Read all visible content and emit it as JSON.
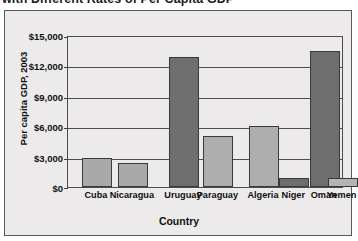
{
  "title": {
    "text": "with Different Rates of Per Capita GDP"
  },
  "chart_data": {
    "type": "bar",
    "title": "with Different Rates of Per Capita GDP",
    "xlabel": "Country",
    "ylabel": "Per capita GDP, 2003",
    "categories": [
      "Cuba",
      "Nicaragua",
      "Uruguay",
      "Paraguay",
      "Algeria",
      "Niger",
      "Oman",
      "Yemen"
    ],
    "values": [
      2900,
      2400,
      12800,
      5000,
      6050,
      900,
      13400,
      900
    ],
    "bar_colors": [
      "#a9a9a9",
      "#a9a9a9",
      "#6e6e6e",
      "#aeaeae",
      "#aeaeae",
      "#6e6e6e",
      "#6e6e6e",
      "#b4b4b4"
    ],
    "ylim": [
      0,
      15000
    ],
    "ytick_values": [
      0,
      3000,
      6000,
      9000,
      12000,
      15000
    ],
    "ytick_labels": [
      "$0",
      "$3,000",
      "$6,000",
      "$9,000",
      "$12,000",
      "$15,000"
    ],
    "grid": true,
    "legend": "none",
    "bar_centers_pct": [
      10.5,
      23.5,
      42.0,
      54.5,
      71.0,
      82.0,
      93.0,
      99.5
    ]
  }
}
